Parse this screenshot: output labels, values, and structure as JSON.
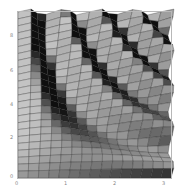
{
  "chart_data": {
    "type": "surface3d",
    "title": "",
    "function": "sin(x*y)",
    "view": "top-down perspective",
    "shading": "grayscale lighting",
    "xlabel": "",
    "ylabel": "",
    "xlim": [
      0,
      3
    ],
    "ylim": [
      0,
      9
    ],
    "x_ticks": [
      "0",
      "1",
      "2",
      "3"
    ],
    "y_ticks": [
      "0",
      "2",
      "4",
      "6",
      "8"
    ],
    "grid_x": 15,
    "grid_y": 24,
    "colors": {
      "frame": "#b8b8b8",
      "tick_label": "#888888",
      "background": "#ffffff"
    }
  },
  "axes": {
    "x_ticks": [
      {
        "label": "0",
        "px": 17
      },
      {
        "label": "1",
        "px": 66
      },
      {
        "label": "2",
        "px": 115
      },
      {
        "label": "3",
        "px": 164
      }
    ],
    "y_ticks": [
      {
        "label": "0",
        "py": 177
      },
      {
        "label": "2",
        "py": 138
      },
      {
        "label": "4",
        "py": 105
      },
      {
        "label": "6",
        "py": 71
      },
      {
        "label": "8",
        "py": 36
      }
    ]
  }
}
